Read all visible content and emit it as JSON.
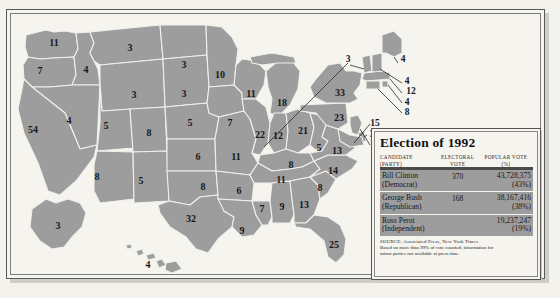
{
  "figure": {
    "kind": "electoral-college-map",
    "title": "Election of 1992"
  },
  "legend": {
    "title": "Election of 1992",
    "columns": {
      "candidate_line1": "CANDIDATE",
      "candidate_line2": "(PARTY)",
      "electoral_line1": "ELECTORAL",
      "electoral_line2": "VOTE",
      "popular_line1": "POPULAR VOTE",
      "popular_line2": "(%)"
    },
    "rows": [
      {
        "candidate": "Bill Clinton",
        "party": "(Democrat)",
        "electoral_vote": "370",
        "popular_vote": "43,728,375",
        "popular_pct": "(43%)"
      },
      {
        "candidate": "George Bush",
        "party": "(Republican)",
        "electoral_vote": "168",
        "popular_vote": "38,167,416",
        "popular_pct": "(38%)"
      },
      {
        "candidate": "Ross Perot",
        "party": "(Independent)",
        "electoral_vote": "",
        "popular_vote": "19,237,247",
        "popular_pct": "(19%)"
      }
    ],
    "source_line1": "SOURCE: Associated Press, New York Times",
    "source_line2": "Based on more than 99% of vote counted; information for",
    "source_line3": "minor parties not available at press time."
  },
  "colors": {
    "map_fill": "#9d9d9d",
    "map_border": "#f2f0eb",
    "page_background": "#f4f2ed",
    "frame_line": "#585653",
    "text": "#15151a"
  },
  "map_labels": [
    {
      "state": "Washington",
      "value": "11",
      "x": 44,
      "y": 30
    },
    {
      "state": "Oregon",
      "value": "7",
      "x": 30,
      "y": 58
    },
    {
      "state": "Idaho",
      "value": "4",
      "x": 76,
      "y": 57
    },
    {
      "state": "Montana",
      "value": "3",
      "x": 120,
      "y": 35
    },
    {
      "state": "Wyoming",
      "value": "3",
      "x": 124,
      "y": 82
    },
    {
      "state": "Nevada",
      "value": "4",
      "x": 59,
      "y": 108
    },
    {
      "state": "Utah",
      "value": "5",
      "x": 96,
      "y": 113
    },
    {
      "state": "California",
      "value": "54",
      "x": 23,
      "y": 117
    },
    {
      "state": "Colorado",
      "value": "8",
      "x": 139,
      "y": 120
    },
    {
      "state": "Arizona",
      "value": "8",
      "x": 87,
      "y": 164
    },
    {
      "state": "New Mexico",
      "value": "5",
      "x": 131,
      "y": 168
    },
    {
      "state": "North Dakota",
      "value": "3",
      "x": 174,
      "y": 52
    },
    {
      "state": "South Dakota",
      "value": "3",
      "x": 174,
      "y": 81
    },
    {
      "state": "Nebraska",
      "value": "5",
      "x": 180,
      "y": 110
    },
    {
      "state": "Kansas",
      "value": "6",
      "x": 188,
      "y": 144
    },
    {
      "state": "Oklahoma",
      "value": "8",
      "x": 193,
      "y": 174
    },
    {
      "state": "Texas",
      "value": "32",
      "x": 181,
      "y": 206
    },
    {
      "state": "Minnesota",
      "value": "10",
      "x": 210,
      "y": 62
    },
    {
      "state": "Iowa",
      "value": "7",
      "x": 220,
      "y": 110
    },
    {
      "state": "Missouri",
      "value": "11",
      "x": 226,
      "y": 144
    },
    {
      "state": "Arkansas",
      "value": "6",
      "x": 229,
      "y": 178
    },
    {
      "state": "Louisiana",
      "value": "9",
      "x": 232,
      "y": 218
    },
    {
      "state": "Wisconsin",
      "value": "11",
      "x": 241,
      "y": 81
    },
    {
      "state": "Illinois",
      "value": "22",
      "x": 250,
      "y": 122
    },
    {
      "state": "Mississippi",
      "value": "7",
      "x": 252,
      "y": 196
    },
    {
      "state": "Michigan",
      "value": "18",
      "x": 272,
      "y": 90
    },
    {
      "state": "Indiana",
      "value": "12",
      "x": 268,
      "y": 123
    },
    {
      "state": "Kentucky",
      "value": "8",
      "x": 281,
      "y": 152
    },
    {
      "state": "Tennessee",
      "value": "11",
      "x": 271,
      "y": 167
    },
    {
      "state": "Alabama",
      "value": "9",
      "x": 272,
      "y": 194
    },
    {
      "state": "Ohio",
      "value": "21",
      "x": 293,
      "y": 118
    },
    {
      "state": "West Virginia",
      "value": "5",
      "x": 309,
      "y": 135
    },
    {
      "state": "Georgia",
      "value": "13",
      "x": 294,
      "y": 192
    },
    {
      "state": "South Carolina",
      "value": "8",
      "x": 310,
      "y": 175
    },
    {
      "state": "Virginia",
      "value": "13",
      "x": 327,
      "y": 138
    },
    {
      "state": "North Carolina",
      "value": "14",
      "x": 323,
      "y": 158
    },
    {
      "state": "Florida",
      "value": "25",
      "x": 324,
      "y": 232
    },
    {
      "state": "New York",
      "value": "33",
      "x": 330,
      "y": 80
    },
    {
      "state": "Pennsylvania",
      "value": "23",
      "x": 329,
      "y": 105
    },
    {
      "state": "Alaska",
      "value": "3",
      "x": 48,
      "y": 213
    },
    {
      "state": "Hawaii",
      "value": "4",
      "x": 138,
      "y": 252
    }
  ],
  "map_leader_labels": [
    {
      "state": "Vermont",
      "value": "3",
      "x": 338,
      "y": 46
    },
    {
      "state": "Maine",
      "value": "4",
      "x": 393,
      "y": 46
    },
    {
      "state": "New Hampshire",
      "value": "4",
      "x": 397,
      "y": 68
    },
    {
      "state": "Massachusetts",
      "value": "12",
      "x": 401,
      "y": 78
    },
    {
      "state": "Rhode Island",
      "value": "4",
      "x": 397,
      "y": 89
    },
    {
      "state": "Connecticut",
      "value": "8",
      "x": 397,
      "y": 99
    },
    {
      "state": "Maryland",
      "value": "15",
      "x": 365,
      "y": 110
    },
    {
      "state": "Delaware",
      "value": "3",
      "x": 362,
      "y": 121
    },
    {
      "state": "New Jersey",
      "value": "10",
      "x": 365,
      "y": 131
    }
  ]
}
